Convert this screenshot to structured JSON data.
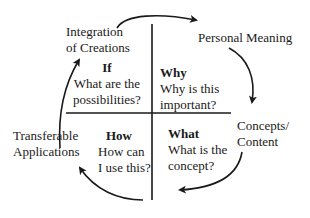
{
  "outer_labels": {
    "top_left": [
      "Integration",
      "of Creations"
    ],
    "top_right": "Personal Meaning",
    "right": [
      "Concepts/",
      "Content"
    ],
    "left": [
      "Transferable",
      "Applications"
    ]
  },
  "quadrants": {
    "top_left": {
      "heading": "If",
      "line1": "What are the",
      "line2": "possibilities?"
    },
    "top_right": {
      "heading": "Why",
      "line1": "Why is this",
      "line2": "important?"
    },
    "bottom_left": {
      "heading": "How",
      "line1": "How can",
      "line2": "I use this?"
    },
    "bottom_right": {
      "heading": "What",
      "line1": "What is the",
      "line2": "concept?"
    }
  },
  "colors": {
    "ink": "#1a1a1a",
    "background": "#ffffff"
  }
}
